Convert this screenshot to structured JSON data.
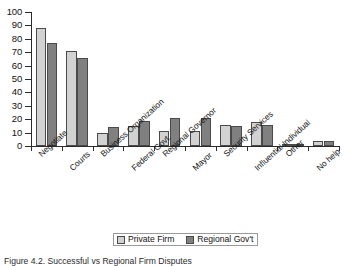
{
  "figure": {
    "caption": "Figure 4.2. Successful vs Regional Firm Disputes"
  },
  "legend": {
    "position": "bottom-center",
    "items": [
      {
        "label": "Private Firm",
        "color": "#d2d2d2",
        "swatch": "legend-swatch-private-firm"
      },
      {
        "label": "Regional Gov't",
        "color": "#808080",
        "swatch": "legend-swatch-regional-govt"
      }
    ]
  },
  "chart_data": {
    "type": "bar",
    "title": "",
    "xlabel": "",
    "ylabel": "",
    "ylim": [
      0,
      100
    ],
    "ytick_step": 10,
    "grid": false,
    "legend_position": "bottom-center",
    "categories": [
      "Negotiate",
      "Courts",
      "Business Organization",
      "Federal Govt.",
      "Regional Governor",
      "Mayor",
      "Security Services",
      "Influential Individual",
      "Other",
      "No help"
    ],
    "ytick_labels": [
      "0",
      "10",
      "20",
      "30",
      "40",
      "50",
      "60",
      "70",
      "80",
      "90",
      "100"
    ],
    "series": [
      {
        "name": "Private Firm",
        "color": "#d2d2d2",
        "values": [
          88,
          71,
          10,
          15,
          11,
          11,
          16,
          18,
          1,
          4
        ]
      },
      {
        "name": "Regional Gov't",
        "color": "#808080",
        "values": [
          77,
          66,
          14,
          19,
          21,
          21,
          15,
          16,
          1,
          4
        ]
      }
    ]
  }
}
